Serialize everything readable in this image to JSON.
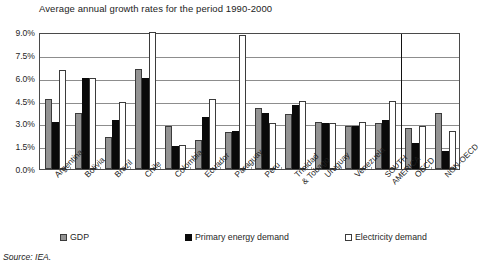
{
  "chart_data": {
    "type": "bar",
    "title": "Average annual growth rates for the period 1990-2000",
    "xlabel": "",
    "ylabel": "",
    "ylim": [
      0,
      9
    ],
    "ytick_labels": [
      "0.0%",
      "1.5%",
      "3.0%",
      "4.5%",
      "6.0%",
      "7.5%",
      "9.0%"
    ],
    "ytick_values": [
      0,
      1.5,
      3.0,
      4.5,
      6.0,
      7.5,
      9.0
    ],
    "grid": true,
    "legend_position": "bottom",
    "categories": [
      "Argentina",
      "Bolivia",
      "Brazil",
      "Chile",
      "Colombia",
      "Ecuador",
      "Paraguay",
      "Peru",
      "Trinidad\n& Tobago",
      "Uruguay",
      "Venezuela",
      "SOUTH\nAMERICA",
      "OECD",
      "NON-OECD"
    ],
    "series": [
      {
        "name": "GDP",
        "color": "#939393",
        "values": [
          4.6,
          3.7,
          2.1,
          6.6,
          2.8,
          1.9,
          2.4,
          4.0,
          3.6,
          3.1,
          2.8,
          3.0,
          2.7,
          3.7
        ]
      },
      {
        "name": "Primary energy demand",
        "color": "#0a0a0a",
        "values": [
          3.1,
          6.0,
          3.2,
          6.0,
          1.5,
          3.4,
          2.5,
          3.7,
          4.2,
          3.0,
          2.8,
          3.2,
          1.7,
          1.2
        ]
      },
      {
        "name": "Electricity demand",
        "color": "#ffffff",
        "values": [
          6.5,
          6.0,
          4.4,
          9.0,
          1.6,
          4.6,
          8.8,
          3.0,
          4.5,
          3.0,
          3.1,
          4.5,
          2.8,
          2.5
        ]
      }
    ],
    "annotations": {
      "oecd_divider_after_category": "SOUTH AMERICA"
    }
  },
  "legend": {
    "items": [
      {
        "label": "GDP",
        "style": "gdp"
      },
      {
        "label": "Primary energy demand",
        "style": "pe"
      },
      {
        "label": "Electricity demand",
        "style": "el"
      }
    ]
  },
  "source": {
    "text": "Source: IEA."
  }
}
